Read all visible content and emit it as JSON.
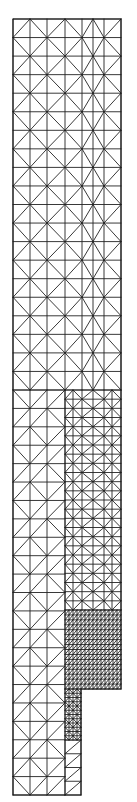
{
  "diagram": {
    "type": "finite-element triangular mesh",
    "stroke_color": "#222222",
    "background": "#ffffff",
    "outline": [
      [
        13,
        19
      ],
      [
        121,
        19
      ],
      [
        121,
        689
      ],
      [
        81,
        689
      ],
      [
        81,
        795
      ],
      [
        13,
        795
      ]
    ],
    "regions": [
      {
        "name": "coarse-upper",
        "xs": [
          13,
          30,
          47,
          65,
          82,
          93,
          104,
          121
        ],
        "y0": 19,
        "y1": 390,
        "rows": 20,
        "pattern": "chevron"
      },
      {
        "name": "coarse-left-column",
        "xs": [
          13,
          30,
          47,
          65
        ],
        "y0": 390,
        "y1": 795,
        "rows": 22,
        "pattern": "fan"
      },
      {
        "name": "medium-right",
        "xs": [
          65,
          73,
          82,
          93,
          104,
          112,
          121
        ],
        "y0": 390,
        "y1": 610,
        "rows": 24,
        "pattern": "chevron"
      },
      {
        "name": "dense-right",
        "xs": [
          65,
          69,
          73,
          77,
          81,
          85,
          89,
          93,
          97,
          101,
          105,
          109,
          113,
          117,
          121
        ],
        "y0": 610,
        "y1": 689,
        "rows": 16,
        "pattern": "diagonal"
      },
      {
        "name": "dense-step",
        "xs": [
          65,
          69,
          73,
          77,
          81
        ],
        "y0": 689,
        "y1": 740,
        "rows": 12,
        "pattern": "chevron"
      },
      {
        "name": "coarse-step-lower",
        "xs": [
          65,
          81
        ],
        "y0": 740,
        "y1": 795,
        "rows": 4,
        "pattern": "diagonal"
      }
    ]
  }
}
